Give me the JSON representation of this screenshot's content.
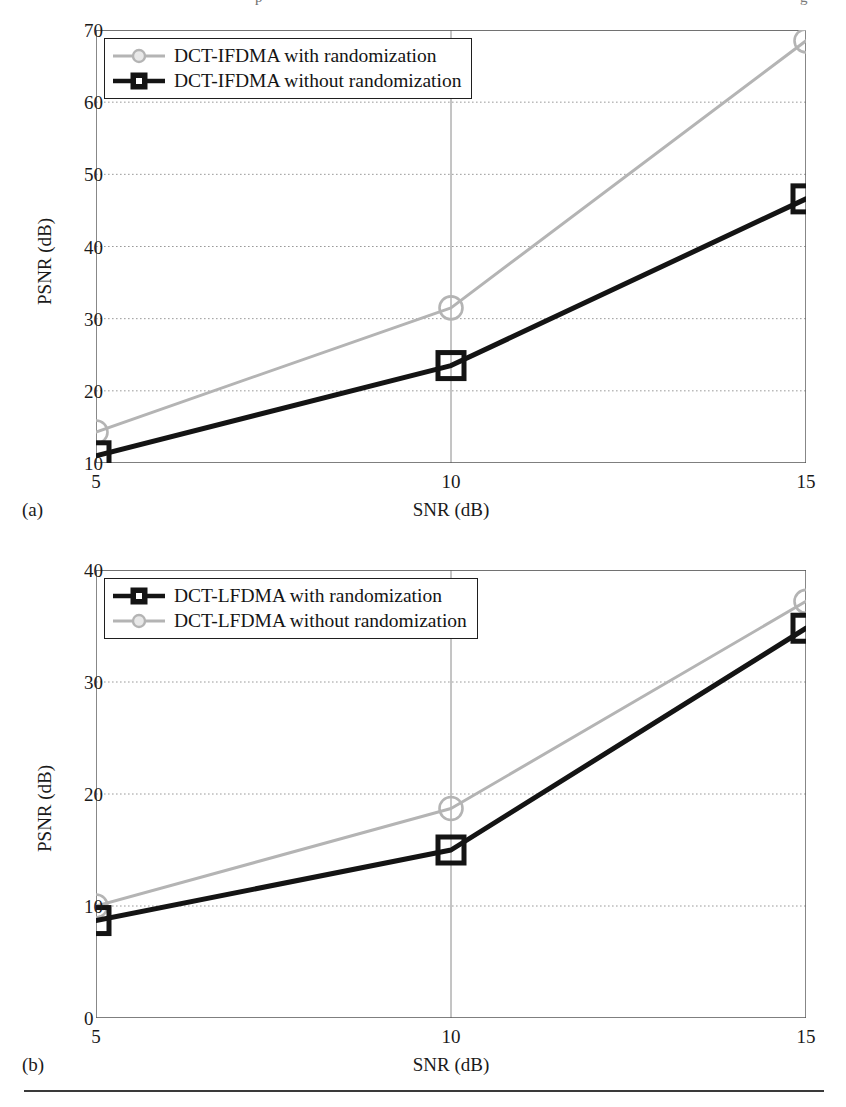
{
  "page": {
    "top_cut_text": "p",
    "top_cut_text_right": "g",
    "footer_rule": true
  },
  "chart_data": [
    {
      "id": "figure-a",
      "type": "line",
      "title": "",
      "subcaption": "(a)",
      "xlabel": "SNR (dB)",
      "ylabel": "PSNR (dB)",
      "x": [
        5,
        10,
        15
      ],
      "xticks": [
        "5",
        "10",
        "15"
      ],
      "yticks": [
        "10",
        "20",
        "30",
        "40",
        "50",
        "60",
        "70"
      ],
      "xlim": [
        5,
        15
      ],
      "ylim": [
        10,
        70
      ],
      "grid": true,
      "legend_position": "upper-left",
      "series": [
        {
          "name": "DCT-IFDMA with randomization",
          "values": [
            14.3,
            31.5,
            68.5
          ],
          "color": "#b4b4b4",
          "marker": "circle"
        },
        {
          "name": "DCT-IFDMA without randomization",
          "values": [
            11.0,
            23.5,
            46.6
          ],
          "color": "#141414",
          "marker": "square"
        }
      ]
    },
    {
      "id": "figure-b",
      "type": "line",
      "title": "",
      "subcaption": "(b)",
      "xlabel": "SNR (dB)",
      "ylabel": "PSNR (dB)",
      "x": [
        5,
        10,
        15
      ],
      "xticks": [
        "5",
        "10",
        "15"
      ],
      "yticks": [
        "0",
        "10",
        "20",
        "30",
        "40"
      ],
      "xlim": [
        5,
        15
      ],
      "ylim": [
        0,
        40
      ],
      "grid": true,
      "legend_position": "upper-left",
      "series": [
        {
          "name": "DCT-LFDMA with randomization",
          "values": [
            8.7,
            15.0,
            34.8
          ],
          "color": "#141414",
          "marker": "square"
        },
        {
          "name": "DCT-LFDMA without randomization",
          "values": [
            10.0,
            18.7,
            37.2
          ],
          "color": "#b4b4b4",
          "marker": "circle"
        }
      ]
    }
  ]
}
